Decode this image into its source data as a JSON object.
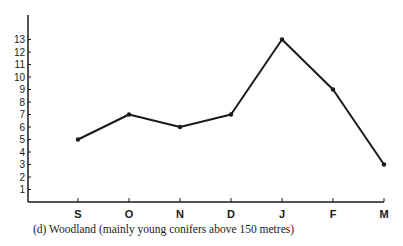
{
  "chart_data": {
    "type": "line",
    "title": "",
    "caption": "(d)  Woodland (mainly young conifers above 150 metres)",
    "xlabel": "",
    "ylabel": "",
    "categories": [
      "S",
      "O",
      "N",
      "D",
      "J",
      "F",
      "M"
    ],
    "series": [
      {
        "name": "Woodland",
        "values": [
          5,
          7,
          6,
          7,
          13,
          9,
          3
        ]
      }
    ],
    "yticks": [
      1,
      2,
      3,
      4,
      5,
      6,
      7,
      8,
      9,
      10,
      11,
      12,
      13
    ],
    "ylim": [
      0,
      13.5
    ],
    "grid": false,
    "legend": "none",
    "colors": {
      "line": "#1a1a1a",
      "axis": "#1a1a1a"
    }
  }
}
